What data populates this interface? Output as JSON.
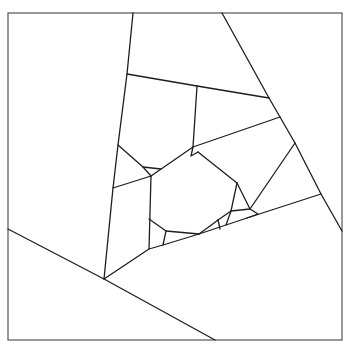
{
  "diagram": {
    "type": "polygon-subdivision",
    "colors": {
      "background": "#ffffff",
      "frame_stroke": "#555555",
      "edge_stroke": "#1e1e1e"
    },
    "frame": {
      "x": 8,
      "y": 13,
      "width": 334,
      "height": 327
    },
    "edges": [
      {
        "id": "left-diagonal",
        "points": [
          [
            133,
            13
          ],
          [
            127,
            74
          ],
          [
            118,
            145
          ],
          [
            113,
            188
          ],
          [
            104,
            279
          ]
        ]
      },
      {
        "id": "right-diagonal",
        "points": [
          [
            222,
            13
          ],
          [
            269,
            98
          ],
          [
            280,
            117
          ],
          [
            295,
            143
          ],
          [
            321,
            194
          ],
          [
            342,
            231
          ]
        ]
      },
      {
        "id": "upper-cross",
        "points": [
          [
            127,
            74
          ],
          [
            197,
            86
          ],
          [
            269,
            98
          ]
        ]
      },
      {
        "id": "inner-vertical",
        "points": [
          [
            197,
            86
          ],
          [
            193,
            147
          ]
        ]
      },
      {
        "id": "mid-cross",
        "points": [
          [
            113,
            188
          ],
          [
            151,
            176
          ],
          [
            193,
            147
          ],
          [
            280,
            117
          ]
        ]
      },
      {
        "id": "lower-wedge",
        "points": [
          [
            104,
            279
          ],
          [
            149,
            249
          ],
          [
            163,
            245
          ],
          [
            199,
            234
          ],
          [
            226,
            225
          ],
          [
            247,
            218
          ],
          [
            321,
            194
          ]
        ]
      },
      {
        "id": "bottom-left-diagonal",
        "points": [
          [
            8,
            229
          ],
          [
            104,
            279
          ],
          [
            215,
            340
          ]
        ]
      },
      {
        "id": "left-notch",
        "points": [
          [
            118,
            145
          ],
          [
            143,
            167
          ],
          [
            151,
            176
          ]
        ]
      },
      {
        "id": "left-notch-cross",
        "points": [
          [
            143,
            167
          ],
          [
            161,
            169
          ]
        ]
      },
      {
        "id": "center-left-vertical",
        "points": [
          [
            151,
            176
          ],
          [
            149,
            249
          ]
        ]
      },
      {
        "id": "inner-left-small",
        "points": [
          [
            149,
            219
          ],
          [
            166,
            231
          ],
          [
            163,
            245
          ]
        ]
      },
      {
        "id": "inner-left-small-cross",
        "points": [
          [
            166,
            231
          ],
          [
            199,
            234
          ]
        ]
      },
      {
        "id": "upper-right-notch",
        "points": [
          [
            193,
            147
          ],
          [
            191,
            156
          ],
          [
            198,
            152
          ]
        ]
      },
      {
        "id": "center-right-diagonal",
        "points": [
          [
            198,
            152
          ],
          [
            237,
            183
          ]
        ]
      },
      {
        "id": "right-inner",
        "points": [
          [
            237,
            183
          ],
          [
            231,
            211
          ],
          [
            226,
            225
          ]
        ]
      },
      {
        "id": "right-inner-cross",
        "points": [
          [
            237,
            183
          ],
          [
            250,
            209
          ],
          [
            295,
            143
          ]
        ]
      },
      {
        "id": "right-inner-cross-2",
        "points": [
          [
            231,
            211
          ],
          [
            250,
            209
          ]
        ]
      },
      {
        "id": "center-bottom-right",
        "points": [
          [
            218,
            220
          ],
          [
            210,
            226
          ],
          [
            199,
            234
          ]
        ]
      },
      {
        "id": "center-bottom-right-2",
        "points": [
          [
            218,
            220
          ],
          [
            231,
            211
          ]
        ]
      },
      {
        "id": "center-bottom-right-3",
        "points": [
          [
            218,
            220
          ],
          [
            220,
            229
          ]
        ]
      },
      {
        "id": "lower-right-small",
        "points": [
          [
            250,
            209
          ],
          [
            258,
            214
          ],
          [
            247,
            218
          ]
        ]
      }
    ]
  }
}
